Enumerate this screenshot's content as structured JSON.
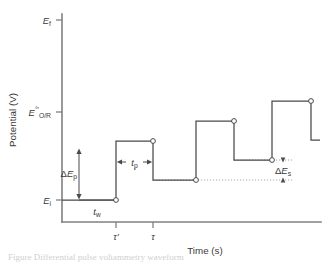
{
  "figure": {
    "type": "waveform-diagram",
    "caption_partial": "Figure  Differential pulse voltammetry waveform"
  },
  "axes": {
    "y_title": "Potential (V)",
    "x_title": "Time (s)",
    "y_ticks": [
      {
        "id": "E_f",
        "base": "E",
        "sup": "",
        "sub": "f",
        "pixel_y": 20
      },
      {
        "id": "E_OR",
        "base": "E",
        "sup": "°′",
        "sub": "O/R",
        "pixel_y": 112
      },
      {
        "id": "E_i",
        "base": "E",
        "sup": "",
        "sub": "i",
        "pixel_y": 200
      }
    ],
    "x_ticks": [
      {
        "id": "tau_prime",
        "label": "τ′",
        "pixel_x": 116
      },
      {
        "id": "tau",
        "label": "τ",
        "pixel_x": 153
      }
    ],
    "origin_x": 62,
    "baseline_y": 222,
    "right_x": 320,
    "top_y": 14
  },
  "annotations": [
    {
      "id": "delta-Ep",
      "base": "ΔE",
      "sub": "p",
      "kind": "vertical-double-arrow"
    },
    {
      "id": "t-w",
      "base": "t",
      "sub": "w",
      "kind": "horizontal-span"
    },
    {
      "id": "t-p",
      "base": "t",
      "sub": "p",
      "kind": "horizontal-double-arrow"
    },
    {
      "id": "delta-Es",
      "base": "ΔE",
      "sub": "s",
      "kind": "vertical-double-arrow"
    }
  ],
  "chart_data": {
    "type": "line",
    "title": "Differential pulse voltammetry waveform",
    "xlabel": "Time (s)",
    "ylabel": "Potential (V)",
    "grid": false,
    "legend": "none",
    "xlim": [
      0,
      1
    ],
    "ylim": [
      0,
      1
    ],
    "y_tick_labels": [
      "E_i",
      "E°′_O/R",
      "E_f"
    ],
    "x_tick_labels": [
      "τ′",
      "τ"
    ],
    "parameters": {
      "delta_E_p": "pulse amplitude",
      "delta_E_s": "step height",
      "t_p": "pulse width",
      "t_w": "wait / step period before pulse"
    },
    "waveform_points_px": [
      [
        62,
        200
      ],
      [
        116,
        200
      ],
      [
        116,
        141
      ],
      [
        153,
        141
      ],
      [
        153,
        180
      ],
      [
        196,
        180
      ],
      [
        196,
        121
      ],
      [
        234,
        121
      ],
      [
        234,
        160
      ],
      [
        272,
        160
      ],
      [
        272,
        101
      ],
      [
        311,
        101
      ],
      [
        311,
        140
      ],
      [
        320,
        140
      ]
    ],
    "sample_markers_px": [
      [
        116,
        200
      ],
      [
        153,
        141
      ],
      [
        196,
        180
      ],
      [
        234,
        121
      ],
      [
        272,
        160
      ],
      [
        311,
        101
      ]
    ],
    "step_levels_px_y": [
      200,
      180,
      160,
      140
    ],
    "pulse_levels_px_y": [
      141,
      121,
      101
    ]
  }
}
